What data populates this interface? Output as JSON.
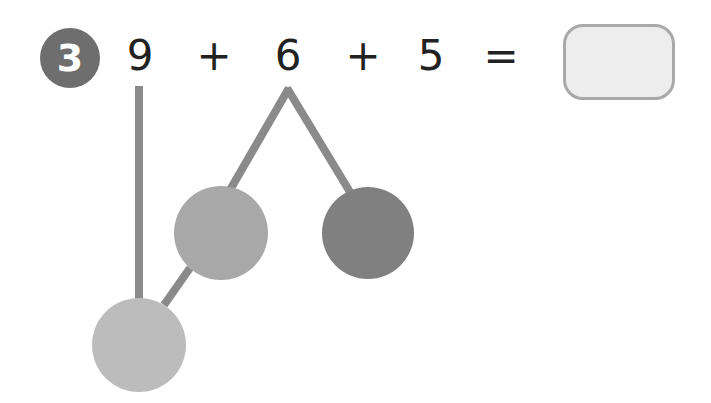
{
  "problem": {
    "number": "3",
    "terms": [
      "9",
      "+",
      "6",
      "+",
      "5",
      "="
    ],
    "answer": ""
  },
  "diagram": {
    "type": "number-bond",
    "circles": [
      {
        "name": "split-part-left",
        "value": "",
        "color": "#a8a8a8"
      },
      {
        "name": "split-part-right",
        "value": "",
        "color": "#808080"
      },
      {
        "name": "combined-result",
        "value": "",
        "color": "#bcbcbc"
      }
    ],
    "line_color": "#8a8a8a"
  }
}
